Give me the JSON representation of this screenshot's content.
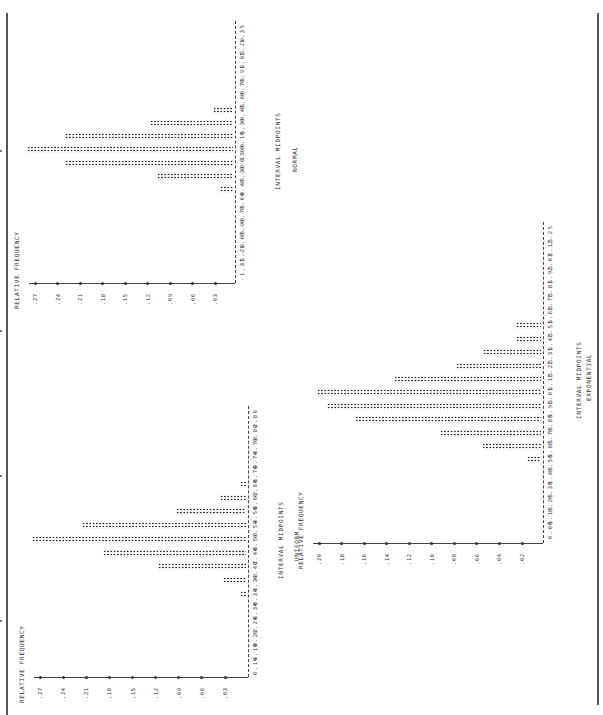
{
  "page": {
    "border_color": "#555555",
    "ink_color": "#222222"
  },
  "charts": {
    "normal": {
      "name": "NORMAL",
      "y_title": "RELATIVE FREQUENCY",
      "x_title": "INTERVAL MIDPOINTS",
      "y_ticks": [
        ".27",
        ".24",
        ".21",
        ".18",
        ".15",
        ".12",
        ".09",
        ".06",
        ".03"
      ],
      "x_labels": [
        "-1.35",
        "-1.20",
        "-1.05",
        "-0.90",
        "-0.75",
        "-0.60",
        "-0.45",
        "-0.30",
        "-0.15",
        "0.00",
        "0.15",
        "0.30",
        "0.45",
        "0.60",
        "0.75",
        "0.90",
        "1.05",
        "1.20",
        "1.35"
      ]
    },
    "uniform": {
      "name": "UNIFORM",
      "y_title": "RELATIVE FREQUENCY",
      "x_title": "INTERVAL MIDPOINTS",
      "y_ticks": [
        ".27",
        ".24",
        ".21",
        ".18",
        ".15",
        ".12",
        ".09",
        ".06",
        ".03"
      ],
      "x_labels": [
        "0.14",
        "0.18",
        "0.22",
        "0.26",
        "0.30",
        "0.34",
        "0.38",
        "0.42",
        "0.46",
        "0.50",
        "0.54",
        "0.58",
        "0.62",
        "0.66",
        "0.70",
        "0.74",
        "0.78",
        "0.82",
        "0.86"
      ]
    },
    "exponential": {
      "name": "EXPONENTIAL",
      "y_title": "RELATIVE FREQUENCY",
      "x_title": "INTERVAL MIDPOINTS",
      "y_ticks": [
        ".20",
        ".18",
        ".16",
        ".14",
        ".12",
        ".10",
        ".08",
        ".06",
        ".04",
        ".02"
      ],
      "x_labels": [
        "0.05",
        "0.15",
        "0.25",
        "0.35",
        "0.45",
        "0.55",
        "0.65",
        "0.75",
        "0.85",
        "0.95",
        "1.05",
        "1.15",
        "1.25",
        "1.35",
        "1.45",
        "1.55",
        "1.65",
        "1.75",
        "1.85",
        "1.95",
        "2.05",
        "2.15",
        "2.25"
      ]
    }
  },
  "chart_data": [
    {
      "type": "bar",
      "title": "NORMAL",
      "orientation": "horizontal (printout rotated 90°)",
      "xlabel": "INTERVAL MIDPOINTS",
      "ylabel": "RELATIVE FREQUENCY",
      "categories": [
        "-1.35",
        "-1.20",
        "-1.05",
        "-0.90",
        "-0.75",
        "-0.60",
        "-0.45",
        "-0.30",
        "-0.15",
        "0.00",
        "0.15",
        "0.30",
        "0.45",
        "0.60",
        "0.75",
        "0.90",
        "1.05",
        "1.20",
        "1.35"
      ],
      "values": [
        0,
        0,
        0,
        0,
        0,
        0,
        0.017,
        0.101,
        0.224,
        0.275,
        0.224,
        0.111,
        0.027,
        0,
        0,
        0,
        0,
        0,
        0
      ],
      "y_ticks": [
        0.03,
        0.06,
        0.09,
        0.12,
        0.15,
        0.18,
        0.21,
        0.24,
        0.27
      ],
      "ylim": [
        0,
        0.28
      ],
      "grid": false
    },
    {
      "type": "bar",
      "title": "UNIFORM",
      "orientation": "horizontal (printout rotated 90°)",
      "xlabel": "INTERVAL MIDPOINTS",
      "ylabel": "RELATIVE FREQUENCY",
      "categories": [
        "0.14",
        "0.18",
        "0.22",
        "0.26",
        "0.30",
        "0.34",
        "0.38",
        "0.42",
        "0.46",
        "0.50",
        "0.54",
        "0.58",
        "0.62",
        "0.66",
        "0.70",
        "0.74",
        "0.78",
        "0.82",
        "0.86"
      ],
      "values": [
        0,
        0,
        0,
        0,
        0,
        0.006,
        0.03,
        0.114,
        0.186,
        0.278,
        0.213,
        0.091,
        0.034,
        0.006,
        0,
        0,
        0,
        0,
        0
      ],
      "y_ticks": [
        0.03,
        0.06,
        0.09,
        0.12,
        0.15,
        0.18,
        0.21,
        0.24,
        0.27
      ],
      "ylim": [
        0,
        0.28
      ],
      "grid": false
    },
    {
      "type": "bar",
      "title": "EXPONENTIAL",
      "orientation": "horizontal (printout rotated 90°)",
      "xlabel": "INTERVAL MIDPOINTS",
      "ylabel": "RELATIVE FREQUENCY",
      "categories": [
        "0.05",
        "0.15",
        "0.25",
        "0.35",
        "0.45",
        "0.55",
        "0.65",
        "0.75",
        "0.85",
        "0.95",
        "1.05",
        "1.15",
        "1.25",
        "1.35",
        "1.45",
        "1.55",
        "1.65",
        "1.75",
        "1.85",
        "1.95",
        "2.05",
        "2.15",
        "2.25"
      ],
      "values": [
        0,
        0,
        0,
        0,
        0,
        0.012,
        0.052,
        0.09,
        0.165,
        0.19,
        0.199,
        0.13,
        0.075,
        0.051,
        0.022,
        0.022,
        0,
        0,
        0,
        0,
        0,
        0,
        0
      ],
      "y_ticks": [
        0.02,
        0.04,
        0.06,
        0.08,
        0.1,
        0.12,
        0.14,
        0.16,
        0.18,
        0.2
      ],
      "ylim": [
        0,
        0.2
      ],
      "grid": false
    }
  ],
  "layout": {
    "normal": {
      "baseline_x": 235,
      "top_label_y": 31,
      "step": 13.2,
      "axis_y": 283,
      "scale_left": 35,
      "scale_right": 215,
      "scale_max": 0.27,
      "scale_min": 0.03,
      "xtitle_x": 274,
      "name_x": 291
    },
    "uniform": {
      "baseline_x": 248,
      "top_label_y": 416,
      "step": 13.7,
      "axis_y": 677,
      "scale_left": 40,
      "scale_right": 225,
      "scale_max": 0.27,
      "scale_min": 0.03,
      "xtitle_x": 277,
      "name_x": 293
    },
    "exponential": {
      "baseline_x": 543,
      "top_label_y": 232,
      "step": 13.4,
      "axis_y": 543,
      "scale_left": 319,
      "scale_right": 522,
      "scale_max": 0.2,
      "scale_min": 0.02,
      "xtitle_x": 575,
      "name_x": 585
    }
  }
}
